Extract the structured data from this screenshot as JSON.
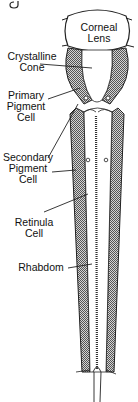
{
  "diagram": {
    "title_fragment": "g",
    "labels": {
      "corneal_lens": [
        "Corneal",
        "Lens"
      ],
      "crystalline_cone": [
        "Crystalline",
        "Cone"
      ],
      "primary_pigment_cell": [
        "Primary",
        "Pigment",
        "Cell"
      ],
      "secondary_pigment_cell": [
        "Secondary",
        "Pigment",
        "Cell"
      ],
      "retinula_cell": [
        "Retinula",
        "Cell"
      ],
      "rhabdom": [
        "Rhabdom"
      ]
    },
    "colors": {
      "line": "#222222",
      "hatch_dark": "#555555",
      "hatch_light": "#cfcfcf",
      "background": "#ffffff"
    }
  }
}
